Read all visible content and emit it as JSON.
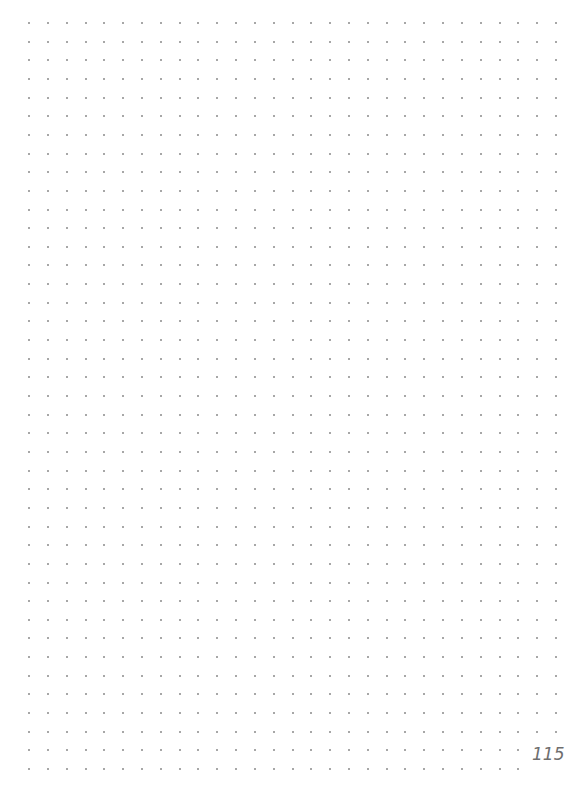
{
  "page": {
    "type": "dot-grid notebook page",
    "page_number": "115",
    "background_color": "#ffffff",
    "dot_color": "#8a8a8a",
    "page_number_color": "#6e6e6e"
  },
  "grid": {
    "origin_x": 29,
    "origin_y": 23,
    "spacing_x": 18.82,
    "spacing_y": 18.65,
    "columns": 29,
    "rows": 41,
    "truncated_rows": [
      {
        "row": 39,
        "last_column": 26
      },
      {
        "row": 40,
        "last_column": 26
      }
    ]
  }
}
